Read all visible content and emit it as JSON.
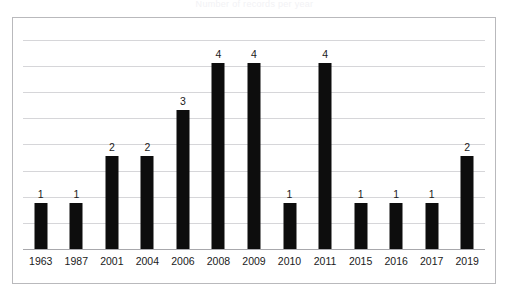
{
  "chart_title_faint": "Number of records per year",
  "chart_data": {
    "type": "bar",
    "title": "",
    "xlabel": "",
    "ylabel": "",
    "categories": [
      "1963",
      "1987",
      "2001",
      "2004",
      "2006",
      "2008",
      "2009",
      "2010",
      "2011",
      "2015",
      "2016",
      "2017",
      "2019"
    ],
    "values": [
      1,
      1,
      2,
      2,
      3,
      4,
      4,
      1,
      4,
      1,
      1,
      1,
      2
    ],
    "data_labels": [
      "1",
      "1",
      "2",
      "2",
      "3",
      "4",
      "4",
      "1",
      "4",
      "1",
      "1",
      "1",
      "2"
    ],
    "ylim": [
      0,
      4.5
    ],
    "gridlines": 9,
    "grid": true,
    "y_tick_labels": [],
    "legend": false,
    "legend_position": "none",
    "series": [
      {
        "name": "",
        "values": [
          1,
          1,
          2,
          2,
          3,
          4,
          4,
          1,
          4,
          1,
          1,
          1,
          2
        ],
        "color": "#0d0d0d"
      }
    ]
  },
  "colors": {
    "bar": "#0d0d0d",
    "gridline": "#d6d6d9",
    "axis": "#a8a8ac",
    "frame": "#b9b9bc",
    "background": "#ffffff",
    "text": "#1a1a1a"
  }
}
